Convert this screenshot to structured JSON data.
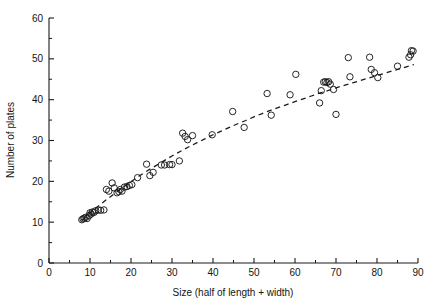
{
  "chart_data": {
    "type": "scatter",
    "title": "",
    "xlabel": "Size (half of length + width)",
    "ylabel": "Number of plates",
    "xlim": [
      0,
      90
    ],
    "ylim": [
      0,
      60
    ],
    "xticks": [
      0,
      10,
      20,
      30,
      40,
      50,
      60,
      70,
      80,
      90
    ],
    "yticks": [
      0,
      10,
      20,
      30,
      40,
      50,
      60
    ],
    "xtick_labels": [
      "0",
      "10",
      "20",
      "30",
      "40",
      "50",
      "60",
      "70",
      "80",
      "90"
    ],
    "ytick_labels": [
      "0",
      "10",
      "20",
      "30",
      "40",
      "50",
      "60"
    ],
    "xminor_step": 5,
    "yminor_step": 5,
    "grid": false,
    "legend": null,
    "marker": "open-circle",
    "marker_size": 3.2,
    "marker_color": "#1a1a1a",
    "series": [
      {
        "name": "observations",
        "points": [
          [
            8.0,
            10.6
          ],
          [
            8.3,
            10.8
          ],
          [
            8.6,
            11.0
          ],
          [
            9.0,
            11.2
          ],
          [
            9.3,
            10.9
          ],
          [
            9.8,
            11.6
          ],
          [
            10.0,
            12.3
          ],
          [
            10.3,
            12.0
          ],
          [
            10.6,
            12.5
          ],
          [
            11.0,
            12.4
          ],
          [
            11.4,
            12.8
          ],
          [
            12.0,
            13.0
          ],
          [
            12.6,
            12.9
          ],
          [
            13.4,
            13.0
          ],
          [
            14.0,
            18.0
          ],
          [
            14.6,
            17.6
          ],
          [
            15.4,
            19.6
          ],
          [
            15.9,
            18.4
          ],
          [
            16.6,
            17.2
          ],
          [
            17.0,
            17.5
          ],
          [
            17.4,
            18.0
          ],
          [
            17.8,
            17.6
          ],
          [
            18.4,
            18.6
          ],
          [
            19.0,
            18.7
          ],
          [
            19.6,
            19.0
          ],
          [
            20.2,
            19.2
          ],
          [
            21.6,
            20.9
          ],
          [
            23.8,
            24.2
          ],
          [
            24.6,
            21.4
          ],
          [
            25.4,
            22.2
          ],
          [
            27.4,
            24.0
          ],
          [
            28.2,
            24.0
          ],
          [
            29.4,
            24.1
          ],
          [
            30.0,
            24.1
          ],
          [
            31.8,
            25.0
          ],
          [
            32.6,
            31.8
          ],
          [
            33.2,
            31.0
          ],
          [
            33.8,
            30.2
          ],
          [
            35.0,
            31.2
          ],
          [
            39.8,
            31.4
          ],
          [
            44.8,
            37.1
          ],
          [
            47.6,
            33.2
          ],
          [
            53.2,
            41.5
          ],
          [
            54.2,
            36.2
          ],
          [
            58.8,
            41.2
          ],
          [
            60.2,
            46.2
          ],
          [
            66.0,
            39.2
          ],
          [
            66.4,
            42.2
          ],
          [
            67.0,
            44.3
          ],
          [
            67.4,
            44.4
          ],
          [
            67.8,
            44.2
          ],
          [
            68.2,
            44.4
          ],
          [
            68.6,
            43.8
          ],
          [
            69.4,
            42.5
          ],
          [
            70.0,
            36.4
          ],
          [
            73.0,
            50.3
          ],
          [
            73.4,
            45.6
          ],
          [
            78.2,
            50.4
          ],
          [
            78.6,
            47.4
          ],
          [
            79.4,
            46.6
          ],
          [
            80.2,
            45.4
          ],
          [
            85.0,
            48.2
          ],
          [
            87.8,
            50.4
          ],
          [
            88.2,
            51.0
          ],
          [
            88.4,
            52.0
          ],
          [
            88.8,
            51.9
          ]
        ]
      }
    ],
    "fit_curve": {
      "name": "fitted-curve",
      "style": "dashed",
      "color": "#1a1a1a",
      "dash_pattern": "5,4",
      "points": [
        [
          8.0,
          10.4
        ],
        [
          10.0,
          12.2
        ],
        [
          12.0,
          13.9
        ],
        [
          14.0,
          15.5
        ],
        [
          16.0,
          17.0
        ],
        [
          18.0,
          18.5
        ],
        [
          20.0,
          19.9
        ],
        [
          22.0,
          21.3
        ],
        [
          24.0,
          22.6
        ],
        [
          26.0,
          23.8
        ],
        [
          28.0,
          25.0
        ],
        [
          30.0,
          26.2
        ],
        [
          32.0,
          27.3
        ],
        [
          34.0,
          28.4
        ],
        [
          36.0,
          29.4
        ],
        [
          38.0,
          30.4
        ],
        [
          40.0,
          31.4
        ],
        [
          42.0,
          32.3
        ],
        [
          44.0,
          33.2
        ],
        [
          46.0,
          34.1
        ],
        [
          48.0,
          34.9
        ],
        [
          50.0,
          35.8
        ],
        [
          52.0,
          36.6
        ],
        [
          54.0,
          37.4
        ],
        [
          56.0,
          38.1
        ],
        [
          58.0,
          38.8
        ],
        [
          60.0,
          39.5
        ],
        [
          62.0,
          40.2
        ],
        [
          64.0,
          40.9
        ],
        [
          66.0,
          41.6
        ],
        [
          68.0,
          42.2
        ],
        [
          70.0,
          42.9
        ],
        [
          72.0,
          43.5
        ],
        [
          74.0,
          44.1
        ],
        [
          76.0,
          44.7
        ],
        [
          78.0,
          45.3
        ],
        [
          80.0,
          45.9
        ],
        [
          82.0,
          46.5
        ],
        [
          84.0,
          47.1
        ],
        [
          86.0,
          47.7
        ],
        [
          88.0,
          48.3
        ],
        [
          89.0,
          48.6
        ]
      ]
    },
    "axis_color": "#1a1a1a",
    "background": "#ffffff"
  },
  "figure": {
    "caption": "",
    "plot_left": 49,
    "plot_right": 418,
    "plot_top": 18,
    "plot_bottom": 263
  }
}
